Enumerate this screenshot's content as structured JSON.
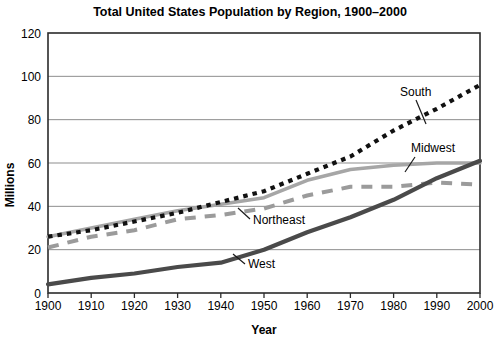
{
  "chart_data": {
    "type": "line",
    "title": "Total United States Population by Region, 1900–2000",
    "xlabel": "Year",
    "ylabel": "Millions",
    "x": [
      1900,
      1910,
      1920,
      1930,
      1940,
      1950,
      1960,
      1970,
      1980,
      1990,
      2000
    ],
    "xlim": [
      1900,
      2000
    ],
    "ylim": [
      0,
      120
    ],
    "yticks": [
      0,
      20,
      40,
      60,
      80,
      100,
      120
    ],
    "xticks": [
      "1900",
      "1910",
      "1920",
      "1930",
      "1940",
      "1950",
      "1960",
      "1970",
      "1980",
      "1990",
      "2000"
    ],
    "grid": "horizontal",
    "legend": "inline-annotations",
    "series": [
      {
        "name": "South",
        "label": "South",
        "style": "dotted",
        "color": "#111111",
        "width": 4.2,
        "values": [
          26,
          29,
          33,
          37,
          42,
          47,
          55,
          63,
          75,
          85,
          96
        ]
      },
      {
        "name": "Midwest",
        "label": "Midwest",
        "style": "solid",
        "color": "#a6a6a6",
        "width": 3.6,
        "values": [
          26,
          30,
          34,
          38,
          41,
          44,
          52,
          57,
          59,
          60,
          60
        ]
      },
      {
        "name": "Northeast",
        "label": "Northeast",
        "style": "dashed",
        "color": "#9b9b9b",
        "width": 4.0,
        "values": [
          21,
          26,
          29,
          34,
          36,
          39,
          45,
          49,
          49,
          51,
          50
        ]
      },
      {
        "name": "West",
        "label": "West",
        "style": "solid",
        "color": "#4a4a4a",
        "width": 4.2,
        "values": [
          4,
          7,
          9,
          12,
          14,
          20,
          28,
          35,
          43,
          53,
          61
        ]
      }
    ],
    "annotations": [
      {
        "text": "South",
        "x": 400,
        "y": 96
      },
      {
        "text": "Midwest",
        "x": 411,
        "y": 152
      },
      {
        "text": "Northeast",
        "x": 253,
        "y": 224
      },
      {
        "text": "West",
        "x": 248,
        "y": 268
      }
    ]
  }
}
